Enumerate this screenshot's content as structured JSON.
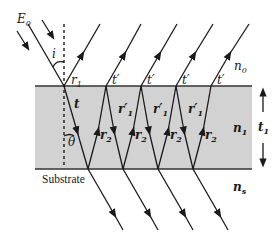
{
  "diagram": {
    "colors": {
      "film": "#d2d2d2",
      "line": "#1a1a1a",
      "background": "#ffffff"
    },
    "labels": {
      "incident_field": "E",
      "incident_field_sub": "0",
      "incidence_angle": "i",
      "refraction_angle": "θ",
      "first_reflection": "r",
      "first_reflection_sub": "1",
      "transmitted_out_top": "t′",
      "transmitted_into_film": "t",
      "internal_reflection_top": "r′",
      "internal_reflection_top_sub": "1",
      "internal_reflection_bottom": "r",
      "internal_reflection_bottom_sub": "2",
      "ambient_index": "n",
      "ambient_index_sub": "0",
      "film_index": "n",
      "film_index_sub": "1",
      "substrate_index": "n",
      "substrate_index_sub": "s",
      "film_thickness": "t",
      "film_thickness_sub": "1",
      "substrate_label": "Substrate"
    }
  }
}
